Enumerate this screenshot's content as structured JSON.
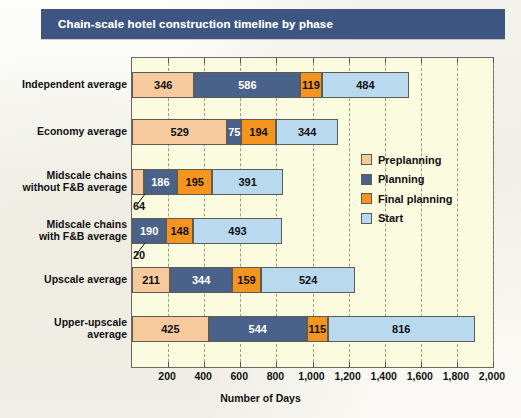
{
  "title": "Chain-scale hotel construction timeline by phase",
  "chart_data": {
    "type": "bar",
    "orientation": "horizontal",
    "stacked": true,
    "title": "Chain-scale hotel construction timeline by phase",
    "xlabel": "Number of Days",
    "ylabel": "",
    "xlim": [
      0,
      2000
    ],
    "xticks": [
      "200",
      "400",
      "600",
      "800",
      "1,000",
      "1,200",
      "1,400",
      "1,600",
      "1,800",
      "2,000"
    ],
    "xtick_values": [
      200,
      400,
      600,
      800,
      1000,
      1200,
      1400,
      1600,
      1800,
      2000
    ],
    "grid": true,
    "grid_style": "dashed-vertical",
    "legend_position": "inside-right",
    "categories": [
      "Independent average",
      "Economy average",
      "Midscale chains without F&B average",
      "Midscale chains with F&B average",
      "Upscale average",
      "Upper-upscale average"
    ],
    "series": [
      {
        "name": "Preplanning",
        "color": "#f7ca9e",
        "values": [
          346,
          529,
          64,
          0,
          211,
          425
        ]
      },
      {
        "name": "Planning",
        "color": "#4a6189",
        "values": [
          586,
          75,
          186,
          190,
          344,
          544
        ]
      },
      {
        "name": "Final planning",
        "color": "#f5941e",
        "values": [
          119,
          194,
          195,
          148,
          159,
          115
        ]
      },
      {
        "name": "Start",
        "color": "#b8d9ee",
        "values": [
          484,
          344,
          391,
          493,
          524,
          816
        ]
      }
    ],
    "totals": [
      1535,
      1142,
      836,
      831,
      1238,
      1900
    ]
  },
  "y_axis": {
    "labels": [
      {
        "lines": [
          "Independent average"
        ]
      },
      {
        "lines": [
          "Economy average"
        ]
      },
      {
        "lines": [
          "Midscale chains",
          "without F&B average"
        ]
      },
      {
        "lines": [
          "Midscale chains",
          "with F&B average"
        ]
      },
      {
        "lines": [
          "Upscale average"
        ]
      },
      {
        "lines": [
          "Upper-upscale",
          "average"
        ]
      }
    ]
  },
  "bar_labels": [
    {
      "row": 0,
      "values": [
        "346",
        "586",
        "119",
        "484"
      ]
    },
    {
      "row": 1,
      "values": [
        "529",
        "75",
        "194",
        "344"
      ]
    },
    {
      "row": 2,
      "values": [
        "",
        "186",
        "195",
        "391"
      ]
    },
    {
      "row": 3,
      "values": [
        "",
        "190",
        "148",
        "493"
      ]
    },
    {
      "row": 4,
      "values": [
        "211",
        "344",
        "159",
        "524"
      ]
    },
    {
      "row": 5,
      "values": [
        "425",
        "544",
        "115",
        "816"
      ]
    }
  ],
  "callouts": [
    {
      "text": "64",
      "row": 2,
      "series": "Preplanning"
    },
    {
      "text": "20",
      "row": 3,
      "series": "Preplanning"
    }
  ],
  "legend": {
    "items": [
      {
        "label": "Preplanning",
        "color": "#f7ca9e"
      },
      {
        "label": "Planning",
        "color": "#4a6189"
      },
      {
        "label": "Final planning",
        "color": "#f5941e"
      },
      {
        "label": "Start",
        "color": "#b8d9ee"
      }
    ]
  },
  "colors": {
    "title_bar": "#3d5581",
    "plot_background": "#fbfbdf",
    "plot_border": "#6a6a62",
    "gridline": "#8a8a80",
    "page_background": "#fbfaf6"
  }
}
